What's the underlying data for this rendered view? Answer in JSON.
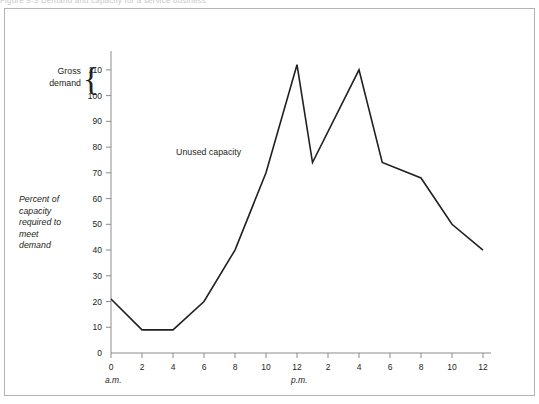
{
  "page": {
    "top_caption": "Figure 9-3   Demand and capacity for a service business"
  },
  "labels": {
    "gross_demand": "Gross\ndemand",
    "gross_demand_line1": "Gross",
    "gross_demand_line2": "demand",
    "brace_glyph": "{",
    "y_axis_title": "Percent of capacity required to meet demand",
    "y_axis_title_lines": [
      "Percent of",
      "capacity",
      "required to",
      "meet",
      "demand"
    ],
    "unused_capacity": "Unused capacity",
    "am": "a.m.",
    "pm": "p.m."
  },
  "chart_data": {
    "type": "line",
    "title": "",
    "xlabel": "",
    "ylabel": "Percent of capacity required to meet demand",
    "ylim": [
      0,
      115
    ],
    "yticks": [
      0,
      10,
      20,
      30,
      40,
      50,
      60,
      70,
      80,
      90,
      100,
      110
    ],
    "ytick_labels": [
      "0",
      "10",
      "20",
      "30",
      "40",
      "50",
      "60",
      "70",
      "80",
      "90",
      "100",
      "110"
    ],
    "xlim": [
      0,
      24
    ],
    "xticks": [
      0,
      2,
      4,
      6,
      8,
      10,
      12,
      14,
      16,
      18,
      20,
      22,
      24
    ],
    "xtick_labels": [
      "0",
      "2",
      "4",
      "6",
      "8",
      "10",
      "12",
      "2",
      "4",
      "6",
      "8",
      "10",
      "12"
    ],
    "x": [
      0,
      2,
      4,
      6,
      8,
      10,
      12,
      13,
      16,
      17.5,
      20,
      22,
      24
    ],
    "values": [
      21,
      9,
      9,
      20,
      40,
      70,
      112,
      74,
      110,
      74,
      68,
      50,
      40
    ],
    "grid": false,
    "legend": false,
    "annotations": [
      {
        "text": "Unused capacity",
        "x": 4.2,
        "y": 77
      },
      {
        "text": "Gross demand",
        "x": -3.0,
        "y": 105
      }
    ],
    "line_color": "#231f20",
    "axis_color": "#8b8b8f"
  },
  "colors": {
    "line": "#231f20",
    "axis": "#8b8b8f",
    "frame": "#b3b3b6",
    "background": "#ffffff",
    "text": "#231f20"
  }
}
